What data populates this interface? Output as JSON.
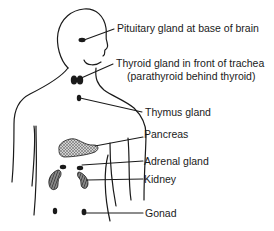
{
  "diagram": {
    "labels": {
      "pituitary": "Pituitary gland at base of brain",
      "thyroid_line1": "Thyroid gland in front of trachea",
      "thyroid_line2": "(parathyroid behind thyroid)",
      "thymus": "Thymus gland",
      "pancreas": "Pancreas",
      "adrenal": "Adrenal gland",
      "kidney": "Kidney",
      "gonad": "Gonad"
    },
    "colors": {
      "ink": "#1a1a1a",
      "background": "#ffffff",
      "pancreas_fill": "#8a8a8a",
      "kidney_fill": "#5a5a5a"
    }
  }
}
